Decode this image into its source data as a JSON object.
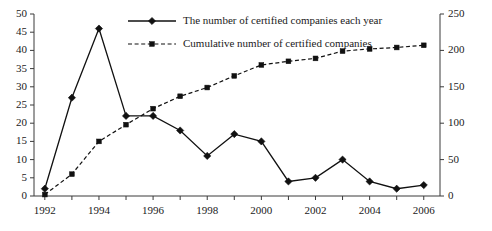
{
  "chart_data": {
    "type": "line",
    "title": "",
    "xlabel": "",
    "ylabel": "",
    "grid": false,
    "legend_position": "top-center",
    "x": [
      1992,
      1993,
      1994,
      1995,
      1996,
      1997,
      1998,
      1999,
      2000,
      2001,
      2002,
      2003,
      2004,
      2005,
      2006
    ],
    "x_tick_labels": [
      "1992",
      "1994",
      "1996",
      "1998",
      "2000",
      "2002",
      "2004",
      "2006"
    ],
    "x_minor_ticks_every": 1,
    "xlim": [
      1991.6,
      2006.6
    ],
    "left_axis": {
      "ylim": [
        0,
        50
      ],
      "ticks": [
        0,
        5,
        10,
        15,
        20,
        25,
        30,
        35,
        40,
        45,
        50
      ],
      "tick_labels": [
        "0",
        "5",
        "10",
        "15",
        "20",
        "25",
        "30",
        "35",
        "40",
        "45",
        "50"
      ]
    },
    "right_axis": {
      "ylim": [
        0,
        250
      ],
      "ticks": [
        0,
        50,
        100,
        150,
        200,
        250
      ],
      "tick_labels": [
        "0",
        "50",
        "100",
        "150",
        "200",
        "250"
      ]
    },
    "series": [
      {
        "name": "The number of certified companies each year",
        "axis": "left",
        "style": "solid",
        "marker": "diamond",
        "color": "#111111",
        "values": [
          2,
          27,
          46,
          22,
          22,
          18,
          11,
          17,
          15,
          4,
          5,
          10,
          4,
          2,
          3
        ]
      },
      {
        "name": "Cumulative number of certified companies",
        "axis": "right",
        "style": "dashed",
        "marker": "square",
        "color": "#111111",
        "values": [
          2,
          30,
          75,
          98,
          120,
          137,
          149,
          165,
          180,
          185,
          189,
          199,
          202,
          204,
          207
        ]
      }
    ]
  },
  "legend": {
    "items": [
      {
        "label": "The number of certified companies each year",
        "style": "solid",
        "marker": "diamond"
      },
      {
        "label": "Cumulative number of certified companies",
        "style": "dashed",
        "marker": "square"
      }
    ]
  },
  "colors": {
    "ink": "#111111",
    "axis": "#3a3a3a",
    "background": "#ffffff"
  }
}
